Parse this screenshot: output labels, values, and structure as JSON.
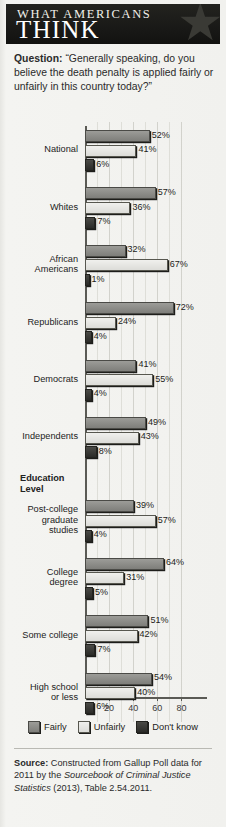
{
  "banner": {
    "line1": "WHAT AMERICANS",
    "line2": "THINK",
    "star_icon": "star-icon"
  },
  "question": {
    "label": "Question:",
    "text": "“Generally speaking, do you believe the death penalty is applied fairly or unfairly in this country today?”"
  },
  "legend": {
    "items": [
      {
        "label": "Fairly",
        "color": "#8a8a86"
      },
      {
        "label": "Unfairly",
        "color": "#e6e6e2"
      },
      {
        "label": "Don't know",
        "color": "#33332f"
      }
    ]
  },
  "source": {
    "label": "Source:",
    "text_a": " Constructed from Gallup Poll data for 2011 by the ",
    "italic": "Sourcebook of Criminal Justice Statistics",
    "text_b": " (2013), Table 2.54.2011."
  },
  "section_headers": [
    {
      "label": "Education Level",
      "after_category": "Independents"
    }
  ],
  "chart_data": {
    "type": "bar",
    "orientation": "horizontal",
    "title": "",
    "xlabel": "",
    "ylabel": "",
    "xlim": [
      0,
      90
    ],
    "ticks": [
      20,
      40,
      60,
      80
    ],
    "grid": true,
    "legend_position": "bottom",
    "value_suffix": "%",
    "categories": [
      "National",
      "Whites",
      "African Americans",
      "Republicans",
      "Democrats",
      "Independents",
      "Post-college graduate studies",
      "College degree",
      "Some college",
      "High school or less"
    ],
    "category_lines": [
      [
        "National"
      ],
      [
        "Whites"
      ],
      [
        "African",
        "Americans"
      ],
      [
        "Republicans"
      ],
      [
        "Democrats"
      ],
      [
        "Independents"
      ],
      [
        "Post-college",
        "graduate",
        "studies"
      ],
      [
        "College",
        "degree"
      ],
      [
        "Some college"
      ],
      [
        "High school",
        "or less"
      ]
    ],
    "series": [
      {
        "name": "Fairly",
        "values": [
          52,
          57,
          32,
          72,
          41,
          49,
          39,
          64,
          51,
          54
        ]
      },
      {
        "name": "Unfairly",
        "values": [
          41,
          36,
          67,
          24,
          55,
          43,
          57,
          31,
          42,
          40
        ]
      },
      {
        "name": "Don't know",
        "values": [
          6,
          7,
          1,
          4,
          4,
          8,
          4,
          5,
          7,
          6
        ]
      }
    ]
  }
}
